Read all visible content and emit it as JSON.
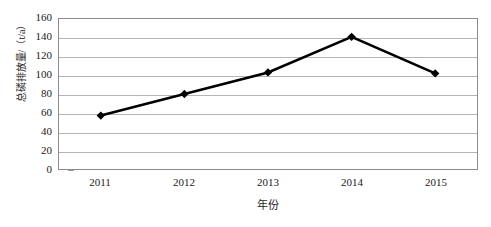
{
  "chart_data": {
    "type": "line",
    "title": "",
    "categories": [
      "2011",
      "2012",
      "2013",
      "2014",
      "2015"
    ],
    "values": [
      57,
      80,
      103,
      141,
      102
    ],
    "series": [
      {
        "name": "总磷排放量",
        "values": [
          57,
          80,
          103,
          141,
          102
        ]
      }
    ],
    "xlabel": "年份",
    "ylabel": "总磷排放量/（t/a）",
    "ylim": [
      0,
      160
    ],
    "ytick_labels": [
      "0",
      "20",
      "40",
      "60",
      "80",
      "100",
      "120",
      "140",
      "160"
    ],
    "ytick_values": [
      0,
      20,
      40,
      60,
      80,
      100,
      120,
      140,
      160
    ],
    "grid": true,
    "legend": "none",
    "marker": "diamond",
    "line_color": "#000000",
    "grid_color": "#b5b5b5",
    "axis_color": "#8c8c8c"
  }
}
